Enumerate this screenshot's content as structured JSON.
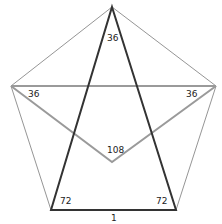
{
  "diagram": {
    "colors": {
      "pentagon": "#7a7a7a",
      "triangle": "#333333",
      "diagonal": "#9a9a9a"
    },
    "vertices": {
      "top": [
        112,
        7
      ],
      "left": [
        11,
        86
      ],
      "right": [
        216,
        86
      ],
      "bottom_left": [
        51,
        210
      ],
      "bottom_right": [
        176,
        210
      ],
      "v_bottom": [
        112,
        162
      ]
    },
    "labels": {
      "apex_angle": "36",
      "left_angle": "36",
      "right_angle": "36",
      "center_angle": "108",
      "bottom_left_angle": "72",
      "bottom_right_angle": "72",
      "base_length": "1"
    }
  }
}
